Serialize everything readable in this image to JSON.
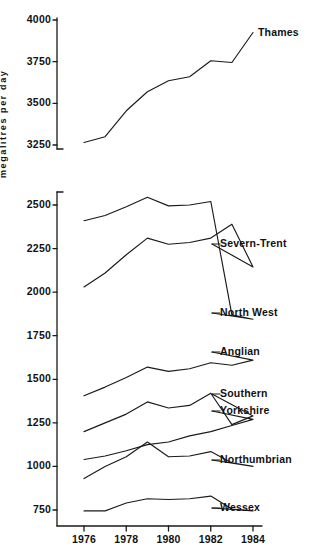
{
  "chart_data": {
    "type": "line",
    "title": "",
    "subtitle": "",
    "xlabel": "",
    "ylabel": "megalitres per day",
    "grid": false,
    "legend_position": "right-inline-labels",
    "panels": [
      {
        "name": "upper-panel-thames",
        "ylim": [
          3250,
          4000
        ],
        "yticks": [
          3250,
          3500,
          3750,
          4000
        ],
        "ytick_labels": [
          "3250",
          "3750",
          "3500",
          "4000"
        ],
        "xlim": [
          1976,
          1984
        ],
        "series": [
          {
            "name": "Thames",
            "label": "Thames",
            "x": [
              1976,
              1977,
              1978,
              1979,
              1980,
              1981,
              1982,
              1983,
              1984
            ],
            "values": [
              3265,
              3300,
              3455,
              3570,
              3635,
              3660,
              3755,
              3745,
              3925
            ]
          }
        ]
      },
      {
        "name": "lower-panel-regions",
        "ylim": [
          750,
          2550
        ],
        "yticks": [
          750,
          1000,
          1250,
          1500,
          1750,
          2000,
          2250,
          2500
        ],
        "xlim": [
          1976,
          1984
        ],
        "series": [
          {
            "name": "Severn-Trent",
            "label": "Severn-Trent",
            "x": [
              1976,
              1977,
              1978,
              1979,
              1980,
              1981,
              1982,
              1983,
              1984
            ],
            "values": [
              2030,
              2110,
              2215,
              2310,
              2275,
              2285,
              2310,
              2390,
              2145
            ]
          },
          {
            "name": "North West",
            "label": "North West",
            "x": [
              1976,
              1977,
              1978,
              1979,
              1980,
              1981,
              1982,
              1983,
              1984
            ],
            "values": [
              2410,
              2440,
              2490,
              2545,
              2495,
              2500,
              2520,
              1870,
              1845
            ]
          },
          {
            "name": "Anglian",
            "label": "Anglian",
            "x": [
              1976,
              1977,
              1978,
              1979,
              1980,
              1981,
              1982,
              1983,
              1984
            ],
            "values": [
              1405,
              1455,
              1510,
              1570,
              1545,
              1560,
              1595,
              1580,
              1610
            ]
          },
          {
            "name": "Southern",
            "label": "Southern",
            "x": [
              1976,
              1977,
              1978,
              1979,
              1980,
              1981,
              1982,
              1983,
              1984
            ],
            "values": [
              1200,
              1250,
              1300,
              1370,
              1335,
              1350,
              1420,
              1240,
              1290
            ]
          },
          {
            "name": "Yorkshire",
            "label": "Yorkshire",
            "x": [
              1976,
              1977,
              1978,
              1979,
              1980,
              1981,
              1982,
              1983,
              1984
            ],
            "values": [
              1040,
              1060,
              1090,
              1125,
              1140,
              1175,
              1200,
              1235,
              1270
            ]
          },
          {
            "name": "Northumbrian",
            "label": "Northumbrian",
            "x": [
              1976,
              1977,
              1978,
              1979,
              1980,
              1981,
              1982,
              1983,
              1984
            ],
            "values": [
              930,
              1000,
              1055,
              1140,
              1055,
              1060,
              1085,
              1020,
              1000
            ]
          },
          {
            "name": "Wessex",
            "label": "Wessex",
            "x": [
              1976,
              1977,
              1978,
              1979,
              1980,
              1981,
              1982,
              1983,
              1984
            ],
            "values": [
              745,
              745,
              790,
              815,
              810,
              815,
              830,
              755,
              745
            ]
          }
        ]
      }
    ],
    "xticks": [
      1976,
      1978,
      1980,
      1982,
      1984
    ],
    "xtick_labels": [
      "1976",
      "1978",
      "1980",
      "1982",
      "1984"
    ]
  },
  "axis": {
    "ylabel_text": "megalitres per day"
  },
  "colors": {
    "line": "#1a1a1a",
    "axis": "#1a1a1a",
    "background": "#ffffff"
  }
}
